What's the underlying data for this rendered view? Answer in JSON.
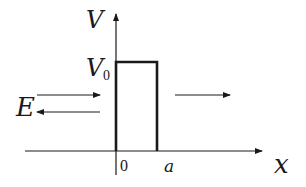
{
  "diagram": {
    "axes": {
      "y_label": "V",
      "x_label": "x"
    },
    "barrier": {
      "height_label": "V",
      "height_subscript": "0",
      "left_edge_label": "0",
      "right_edge_label": "a"
    },
    "energy_label": "E",
    "arrows": [
      {
        "name": "incident-wave",
        "direction": "right"
      },
      {
        "name": "reflected-wave",
        "direction": "left"
      },
      {
        "name": "transmitted-wave",
        "direction": "right"
      }
    ],
    "colors": {
      "stroke": "#1a1a1a",
      "background": "#ffffff"
    }
  }
}
